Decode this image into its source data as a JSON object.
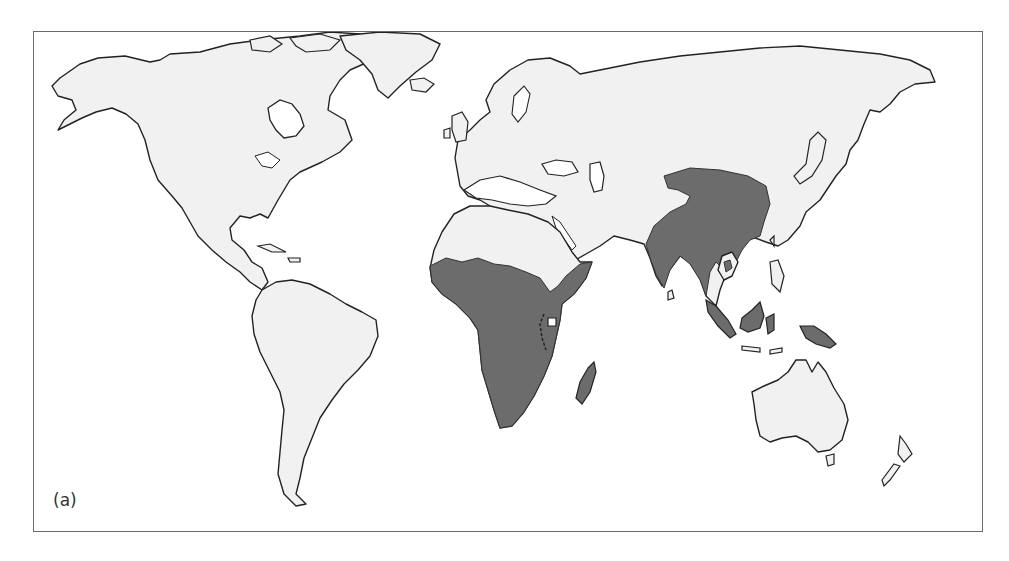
{
  "figure": {
    "panel_label": "(a)",
    "type": "world distribution map",
    "colors": {
      "land": "#f1f1f1",
      "outline": "#222222",
      "highlighted_range": "#6c6c6c",
      "frame": "#6b6b6b"
    },
    "highlighted_regions": [
      "Sub-Saharan Africa",
      "Madagascar",
      "Indian subcontinent",
      "China / East Asia",
      "Mainland Southeast Asia",
      "Sumatra",
      "Borneo",
      "Sulawesi",
      "New Guinea"
    ]
  }
}
